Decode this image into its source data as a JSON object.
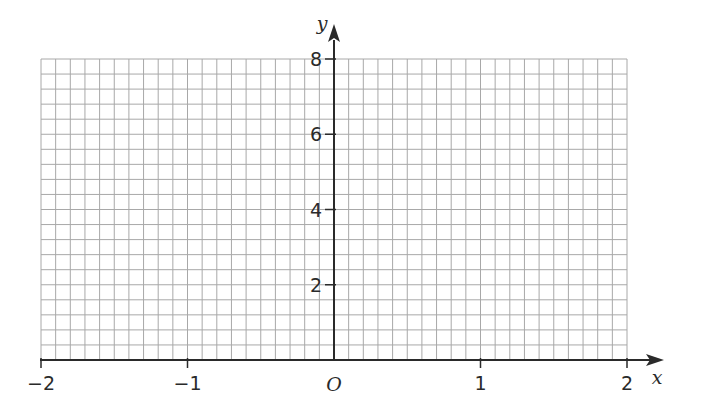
{
  "chart_data": {
    "type": "line",
    "title": "",
    "xlabel": "x",
    "ylabel": "y",
    "origin_label": "O",
    "xlim": [
      -2,
      2
    ],
    "ylim": [
      0,
      8
    ],
    "x_ticks": [
      -2,
      -1,
      1,
      2
    ],
    "x_tick_labels": [
      "−2",
      "−1",
      "1",
      "2"
    ],
    "y_ticks": [
      2,
      4,
      6,
      8
    ],
    "y_tick_labels": [
      "2",
      "4",
      "6",
      "8"
    ],
    "grid": true,
    "grid_minor_step_x": 0.1,
    "grid_minor_step_y": 0.4,
    "series": [],
    "colors": {
      "axis": "#2a2a2a",
      "grid": "#a8a8a8"
    }
  }
}
